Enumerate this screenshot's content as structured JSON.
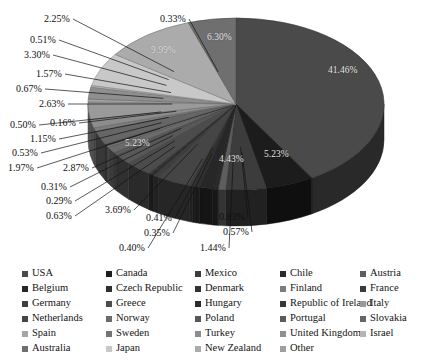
{
  "chart_data": {
    "type": "pie",
    "title": "",
    "three_d": true,
    "legend_position": "bottom",
    "categories": [
      "USA",
      "Canada",
      "Mexico",
      "Chile",
      "Austria",
      "Belgium",
      "Czech Republic",
      "Denmark",
      "Finland",
      "France",
      "Germany",
      "Greece",
      "Hungary",
      "Republic of Ireland",
      "Italy",
      "Netherlands",
      "Norway",
      "Poland",
      "Portugal",
      "Slovakia",
      "Spain",
      "Sweden",
      "Turkey",
      "United Kingdom",
      "Israel",
      "Australia",
      "Japan",
      "New Zealand",
      "Other"
    ],
    "values": [
      41.46,
      5.23,
      4.43,
      0.83,
      0.57,
      1.44,
      0.4,
      0.35,
      0.41,
      3.69,
      0.63,
      0.29,
      0.31,
      2.87,
      1.97,
      0.53,
      1.15,
      0.5,
      0.16,
      2.63,
      0.67,
      1.57,
      3.3,
      0.51,
      2.25,
      0.33,
      6.3,
      9.99,
      5.23
    ],
    "unit": "%",
    "colors": [
      "#4a4a4a",
      "#1c1c1c",
      "#3c3c3c",
      "#5e5e5e",
      "#2a2a2a",
      "#272727",
      "#2f2f2f",
      "#333333",
      "#3a3a3a",
      "#454545",
      "#3e3e3e",
      "#2b2b2b",
      "#363636",
      "#4c4c4c",
      "#585858",
      "#5c5c5c",
      "#6b6b6b",
      "#747474",
      "#1e1e1e",
      "#666666",
      "#7d7d7d",
      "#8c8c8c",
      "#9a9a9a",
      "#a6a6a6",
      "#8f8f8f",
      "#b4b4b4",
      "#c8c8c8",
      "#ababab",
      "#6f6f6f"
    ]
  },
  "pie": {
    "callout_labels": [
      {
        "text": "2.25%",
        "x": 44,
        "y": 14
      },
      {
        "text": "0.33%",
        "x": 160,
        "y": 14
      },
      {
        "text": "0.51%",
        "x": 30,
        "y": 35
      },
      {
        "text": "3.30%",
        "x": 24,
        "y": 50
      },
      {
        "text": "1.57%",
        "x": 36,
        "y": 69
      },
      {
        "text": "0.67%",
        "x": 16,
        "y": 84
      },
      {
        "text": "2.63%",
        "x": 39,
        "y": 99
      },
      {
        "text": "0.50%",
        "x": 10,
        "y": 120
      },
      {
        "text": "0.16%",
        "x": 50,
        "y": 118
      },
      {
        "text": "1.15%",
        "x": 30,
        "y": 134
      },
      {
        "text": "0.53%",
        "x": 12,
        "y": 148
      },
      {
        "text": "1.97%",
        "x": 8,
        "y": 163
      },
      {
        "text": "2.87%",
        "x": 63,
        "y": 163
      },
      {
        "text": "0.31%",
        "x": 41,
        "y": 182
      },
      {
        "text": "0.29%",
        "x": 46,
        "y": 196
      },
      {
        "text": "3.69%",
        "x": 105,
        "y": 205
      },
      {
        "text": "0.63%",
        "x": 46,
        "y": 211
      },
      {
        "text": "0.41%",
        "x": 146,
        "y": 213
      },
      {
        "text": "0.83%",
        "x": 219,
        "y": 212
      },
      {
        "text": "0.57%",
        "x": 223,
        "y": 227
      },
      {
        "text": "0.35%",
        "x": 144,
        "y": 228
      },
      {
        "text": "0.40%",
        "x": 119,
        "y": 243
      },
      {
        "text": "1.44%",
        "x": 200,
        "y": 243
      }
    ],
    "inner_labels": [
      {
        "text": "41.46%",
        "x": 328,
        "y": 66
      },
      {
        "text": "9.99%",
        "x": 151,
        "y": 46
      },
      {
        "text": "6.30%",
        "x": 207,
        "y": 33
      },
      {
        "text": "5.23%",
        "x": 264,
        "y": 150
      },
      {
        "text": "4.43%",
        "x": 219,
        "y": 155
      },
      {
        "text": "5.23%",
        "x": 125,
        "y": 139
      }
    ]
  },
  "legend": {
    "columns_x": [
      22,
      106,
      195,
      280,
      360
    ],
    "rows_y": [
      0,
      15,
      30,
      45,
      60
    ],
    "items": [
      {
        "label": "USA",
        "color": "#4a4a4a",
        "col": 0,
        "row": 0
      },
      {
        "label": "Canada",
        "color": "#1c1c1c",
        "col": 1,
        "row": 0
      },
      {
        "label": "Mexico",
        "color": "#3c3c3c",
        "col": 2,
        "row": 0
      },
      {
        "label": "Chile",
        "color": "#2a2a2a",
        "col": 3,
        "row": 0
      },
      {
        "label": "Austria",
        "color": "#5e5e5e",
        "col": 4,
        "row": 0
      },
      {
        "label": "Belgium",
        "color": "#272727",
        "col": 0,
        "row": 1
      },
      {
        "label": "Czech Republic",
        "color": "#2f2f2f",
        "col": 1,
        "row": 1
      },
      {
        "label": "Denmark",
        "color": "#333333",
        "col": 2,
        "row": 1
      },
      {
        "label": "Finland",
        "color": "#7d7d7d",
        "col": 3,
        "row": 1
      },
      {
        "label": "France",
        "color": "#3a3a3a",
        "col": 4,
        "row": 1
      },
      {
        "label": "Germany",
        "color": "#3e3e3e",
        "col": 0,
        "row": 2
      },
      {
        "label": "Greece",
        "color": "#4c4c4c",
        "col": 1,
        "row": 2
      },
      {
        "label": "Hungary",
        "color": "#2b2b2b",
        "col": 2,
        "row": 2
      },
      {
        "label": "Republic of Ireland",
        "color": "#363636",
        "col": 3,
        "row": 2
      },
      {
        "label": "Italy",
        "color": "#9a9a9a",
        "col": 4,
        "row": 2
      },
      {
        "label": "Netherlands",
        "color": "#454545",
        "col": 0,
        "row": 3
      },
      {
        "label": "Norway",
        "color": "#6b6b6b",
        "col": 1,
        "row": 3
      },
      {
        "label": "Poland",
        "color": "#585858",
        "col": 2,
        "row": 3
      },
      {
        "label": "Portugal",
        "color": "#5c5c5c",
        "col": 3,
        "row": 3
      },
      {
        "label": "Slovakia",
        "color": "#666666",
        "col": 4,
        "row": 3
      },
      {
        "label": "Spain",
        "color": "#a6a6a6",
        "col": 0,
        "row": 4
      },
      {
        "label": "Sweden",
        "color": "#747474",
        "col": 1,
        "row": 4
      },
      {
        "label": "Turkey",
        "color": "#8c8c8c",
        "col": 2,
        "row": 4
      },
      {
        "label": "United Kingdom",
        "color": "#8f8f8f",
        "col": 3,
        "row": 4
      },
      {
        "label": "Israel",
        "color": "#b4b4b4",
        "col": 4,
        "row": 4
      },
      {
        "label": "Australia",
        "color": "#6f6f6f",
        "col": 0,
        "row": 5
      },
      {
        "label": "Japan",
        "color": "#c8c8c8",
        "col": 1,
        "row": 5
      },
      {
        "label": "New Zealand",
        "color": "#ababab",
        "col": 2,
        "row": 5
      },
      {
        "label": "Other",
        "color": "#9f9f9f",
        "col": 3,
        "row": 5
      }
    ]
  }
}
